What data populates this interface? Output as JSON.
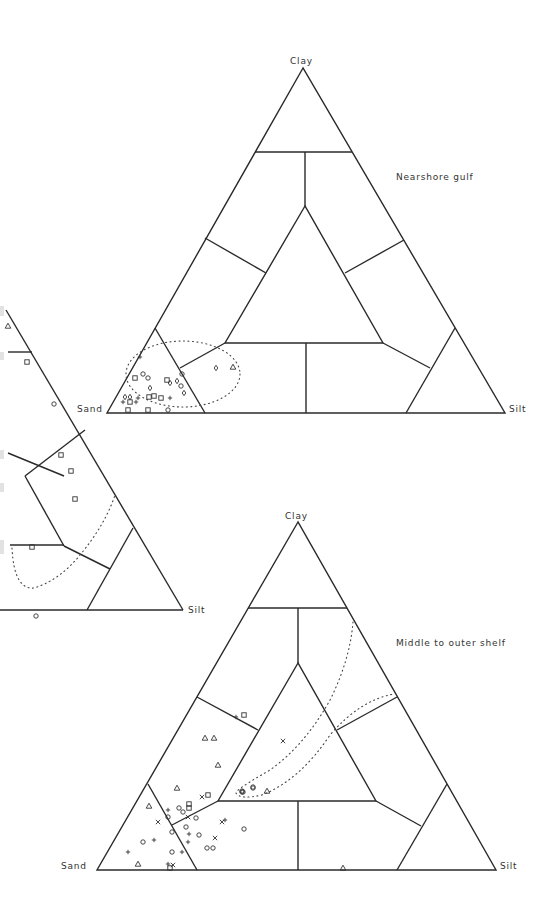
{
  "chart_data": [
    {
      "type": "ternary-scatter",
      "title": "Nearshore gulf",
      "axes": {
        "top": "Clay",
        "left": "Sand",
        "right": "Silt"
      },
      "frame": {
        "apex": [
          303,
          68
        ],
        "left": [
          107,
          413
        ],
        "right": [
          505,
          413
        ]
      },
      "field_boundaries": "Shepard (1954) sediment classification",
      "envelope": "dotted ellipse around sand-rich samples",
      "points": [
        {
          "m": "plus",
          "x": 140,
          "y": 357
        },
        {
          "m": "square",
          "x": 135,
          "y": 378
        },
        {
          "m": "circle",
          "x": 143,
          "y": 374
        },
        {
          "m": "circle",
          "x": 148,
          "y": 378
        },
        {
          "m": "square",
          "x": 167,
          "y": 380
        },
        {
          "m": "diamond",
          "x": 170,
          "y": 383
        },
        {
          "m": "diamond",
          "x": 177,
          "y": 381
        },
        {
          "m": "circle",
          "x": 182,
          "y": 374
        },
        {
          "m": "diamond",
          "x": 150,
          "y": 388
        },
        {
          "m": "circle",
          "x": 181,
          "y": 386
        },
        {
          "m": "diamond",
          "x": 184,
          "y": 393
        },
        {
          "m": "diamond",
          "x": 125,
          "y": 397
        },
        {
          "m": "diamond",
          "x": 130,
          "y": 397
        },
        {
          "m": "plus",
          "x": 138,
          "y": 398
        },
        {
          "m": "square",
          "x": 149,
          "y": 397
        },
        {
          "m": "square",
          "x": 154,
          "y": 396
        },
        {
          "m": "square",
          "x": 161,
          "y": 398
        },
        {
          "m": "plus",
          "x": 170,
          "y": 398
        },
        {
          "m": "plus",
          "x": 123,
          "y": 402
        },
        {
          "m": "square",
          "x": 130,
          "y": 402
        },
        {
          "m": "plus",
          "x": 136,
          "y": 402
        },
        {
          "m": "square",
          "x": 128,
          "y": 410
        },
        {
          "m": "square",
          "x": 148,
          "y": 410
        },
        {
          "m": "circle",
          "x": 168,
          "y": 410
        },
        {
          "m": "diamond",
          "x": 216,
          "y": 368
        },
        {
          "m": "triangle",
          "x": 233,
          "y": 367
        }
      ]
    },
    {
      "type": "ternary-scatter",
      "title": "Middle to outer shelf",
      "axes": {
        "top": "Clay",
        "left": "Sand",
        "right": "Silt"
      },
      "frame": {
        "apex": [
          298,
          522
        ],
        "left": [
          97,
          870
        ],
        "right": [
          496,
          870
        ]
      },
      "field_boundaries": "Shepard (1954) sediment classification",
      "envelope": "dotted hooked envelope extending from lower-left toward clayey silt",
      "points": [
        {
          "m": "plus",
          "x": 236,
          "y": 717
        },
        {
          "m": "square",
          "x": 244,
          "y": 715
        },
        {
          "m": "triangle",
          "x": 205,
          "y": 738
        },
        {
          "m": "triangle",
          "x": 214,
          "y": 738
        },
        {
          "m": "triangle",
          "x": 218,
          "y": 765
        },
        {
          "m": "cross",
          "x": 283,
          "y": 741
        },
        {
          "m": "triangle",
          "x": 177,
          "y": 788
        },
        {
          "m": "cross",
          "x": 202,
          "y": 797
        },
        {
          "m": "square",
          "x": 208,
          "y": 795
        },
        {
          "m": "circle",
          "x": 242,
          "y": 791
        },
        {
          "m": "circle",
          "x": 253,
          "y": 787
        },
        {
          "m": "triangle",
          "x": 267,
          "y": 791
        },
        {
          "m": "triangle",
          "x": 149,
          "y": 806
        },
        {
          "m": "circle",
          "x": 179,
          "y": 808
        },
        {
          "m": "circle",
          "x": 183,
          "y": 812
        },
        {
          "m": "square",
          "x": 189,
          "y": 804
        },
        {
          "m": "square",
          "x": 189,
          "y": 808
        },
        {
          "m": "plus",
          "x": 168,
          "y": 810
        },
        {
          "m": "cross",
          "x": 188,
          "y": 817
        },
        {
          "m": "circle",
          "x": 196,
          "y": 818
        },
        {
          "m": "cross",
          "x": 158,
          "y": 822
        },
        {
          "m": "circle",
          "x": 168,
          "y": 817
        },
        {
          "m": "cross",
          "x": 222,
          "y": 822
        },
        {
          "m": "plus",
          "x": 225,
          "y": 820
        },
        {
          "m": "circle",
          "x": 244,
          "y": 829
        },
        {
          "m": "circle",
          "x": 172,
          "y": 832
        },
        {
          "m": "circle",
          "x": 186,
          "y": 827
        },
        {
          "m": "plus",
          "x": 189,
          "y": 834
        },
        {
          "m": "circle",
          "x": 199,
          "y": 835
        },
        {
          "m": "cross",
          "x": 215,
          "y": 838
        },
        {
          "m": "circle",
          "x": 143,
          "y": 842
        },
        {
          "m": "plus",
          "x": 154,
          "y": 840
        },
        {
          "m": "plus",
          "x": 188,
          "y": 842
        },
        {
          "m": "circle",
          "x": 207,
          "y": 848
        },
        {
          "m": "circle",
          "x": 213,
          "y": 848
        },
        {
          "m": "plus",
          "x": 128,
          "y": 852
        },
        {
          "m": "circle",
          "x": 172,
          "y": 852
        },
        {
          "m": "plus",
          "x": 182,
          "y": 852
        },
        {
          "m": "triangle",
          "x": 138,
          "y": 864
        },
        {
          "m": "plus",
          "x": 168,
          "y": 864
        },
        {
          "m": "cross",
          "x": 173,
          "y": 865
        },
        {
          "m": "square",
          "x": 170,
          "y": 868
        },
        {
          "m": "circle",
          "x": 243,
          "y": 792
        },
        {
          "m": "circle",
          "x": 253,
          "y": 788
        },
        {
          "m": "circle",
          "x": 242,
          "y": 792
        },
        {
          "m": "triangle",
          "x": 343,
          "y": 868
        }
      ]
    },
    {
      "type": "ternary-scatter",
      "title": "",
      "note": "partially cropped diagram at left edge",
      "axes": {
        "right": "Silt"
      },
      "points": [
        {
          "m": "triangle",
          "x": 8,
          "y": 326
        },
        {
          "m": "square",
          "x": 27,
          "y": 362
        },
        {
          "m": "circle",
          "x": 54,
          "y": 404
        },
        {
          "m": "square",
          "x": 61,
          "y": 455
        },
        {
          "m": "square",
          "x": 71,
          "y": 471
        },
        {
          "m": "square",
          "x": 75,
          "y": 499
        },
        {
          "m": "square",
          "x": 32,
          "y": 547
        },
        {
          "m": "circle",
          "x": 36,
          "y": 616
        }
      ]
    }
  ],
  "labels": {
    "top": {
      "clay": "Clay",
      "sand": "Sand",
      "silt": "Silt",
      "title": "Nearshore gulf"
    },
    "bottom": {
      "clay": "Clay",
      "sand": "Sand",
      "silt": "Silt",
      "title": "Middle to outer shelf"
    },
    "left_partial": {
      "silt": "Silt"
    }
  }
}
